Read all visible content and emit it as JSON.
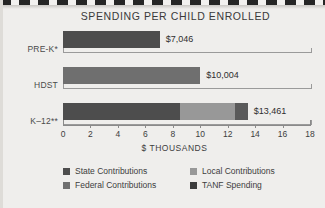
{
  "chart_data": {
    "type": "bar",
    "orientation": "horizontal",
    "stacked": true,
    "title": "SPENDING PER CHILD ENROLLED",
    "xlabel": "$ THOUSANDS",
    "ylabel": "",
    "xlim": [
      0,
      18
    ],
    "xticks": [
      0,
      2,
      4,
      6,
      8,
      10,
      12,
      14,
      16,
      18
    ],
    "xtick_labels": [
      "0",
      "2",
      "4",
      "6",
      "8",
      "10",
      "12",
      "14",
      "16",
      "18"
    ],
    "grid": false,
    "legend_position": "bottom",
    "categories": [
      "PRE-K*",
      "HDST",
      "K–12**"
    ],
    "series": [
      {
        "name": "State Contributions",
        "color": "#4d4d4d",
        "values": [
          7.046,
          0,
          8.5
        ]
      },
      {
        "name": "Federal Contributions",
        "color": "#6f6f6f",
        "values": [
          0,
          10.004,
          0
        ]
      },
      {
        "name": "Local Contributions",
        "color": "#989898",
        "values": [
          0,
          0,
          4.0
        ]
      },
      {
        "name": "TANF Spending",
        "color": "#5a5a5a",
        "values": [
          0,
          0,
          0.961
        ]
      }
    ],
    "bars": [
      {
        "category": "PRE-K*",
        "total": 7.046,
        "value_label": "$7,046",
        "segments": [
          {
            "series": "State Contributions",
            "start": 0,
            "end": 7.046,
            "color": "#4d4d4d"
          }
        ]
      },
      {
        "category": "HDST",
        "total": 10.004,
        "value_label": "$10,004",
        "segments": [
          {
            "series": "Federal Contributions",
            "start": 0,
            "end": 10.004,
            "color": "#6f6f6f"
          }
        ]
      },
      {
        "category": "K–12**",
        "total": 13.461,
        "value_label": "$13,461",
        "segments": [
          {
            "series": "State Contributions",
            "start": 0,
            "end": 8.5,
            "color": "#4d4d4d"
          },
          {
            "series": "Local Contributions",
            "start": 8.5,
            "end": 12.5,
            "color": "#989898"
          },
          {
            "series": "TANF Spending",
            "start": 12.5,
            "end": 13.461,
            "color": "#5a5a5a"
          }
        ]
      }
    ],
    "legend": [
      {
        "label": "State Contributions",
        "color": "#4d4d4d"
      },
      {
        "label": "Federal Contributions",
        "color": "#6f6f6f"
      },
      {
        "label": "Local Contributions",
        "color": "#989898"
      },
      {
        "label": "TANF Spending",
        "color": "#3c3c3c"
      }
    ]
  }
}
